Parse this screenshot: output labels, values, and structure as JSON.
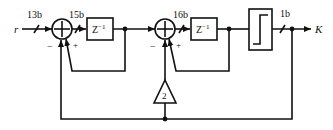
{
  "diagram": {
    "title": "",
    "input_label": "r",
    "output_label": "K",
    "bus_widths": {
      "input": "13b",
      "summer1_out": "15b",
      "summer2_out": "16b",
      "quantizer_out": "1b"
    },
    "blocks": {
      "delay1": {
        "label": "Z",
        "sup": "−1"
      },
      "delay2": {
        "label": "Z",
        "sup": "−1"
      },
      "gain": {
        "label": "2"
      },
      "quantizer": {
        "label": ""
      }
    },
    "summer_signs": {
      "summer1_minus": "−",
      "summer1_plus": "+",
      "summer2_minus": "−",
      "summer2_plus": "+"
    },
    "colors": {
      "stroke": "#111111",
      "background": "#ffffff"
    }
  }
}
